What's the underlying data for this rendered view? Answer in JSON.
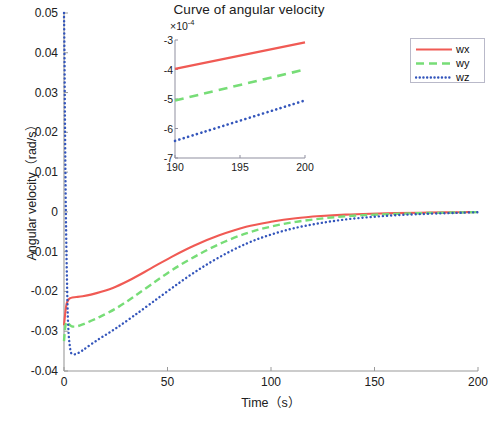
{
  "chart_data": {
    "type": "line",
    "title": "Curve of angular velocity",
    "xlabel": "Time（s）",
    "ylabel": "Angular velocity（rad/s）",
    "xlim": [
      0,
      200
    ],
    "ylim": [
      -0.04,
      0.05
    ],
    "xticks": [
      0,
      50,
      100,
      150,
      200
    ],
    "xtick_labels": [
      "0",
      "50",
      "100",
      "150",
      "200"
    ],
    "yticks": [
      0.05,
      0.04,
      0.03,
      0.02,
      0.01,
      0,
      -0.01,
      -0.02,
      -0.03,
      -0.04
    ],
    "ytick_labels": [
      "0.05",
      "0.04",
      "0.03",
      "0.02",
      "0.01",
      "0",
      "-0.01",
      "-0.02",
      "-0.03",
      "-0.04"
    ],
    "grid": false,
    "legend_position": "top-right",
    "series": [
      {
        "name": "wx",
        "color": "#f05a54",
        "style": "solid",
        "x": [
          0,
          0.6,
          1.2,
          2,
          3,
          4,
          6,
          9,
          13,
          18,
          25,
          33,
          42,
          52,
          63,
          75,
          88,
          100,
          112,
          124,
          136,
          148,
          160,
          172,
          184,
          192,
          200
        ],
        "y": [
          -0.0285,
          -0.0255,
          -0.0232,
          -0.0222,
          -0.0217,
          -0.0215,
          -0.0214,
          -0.0212,
          -0.0208,
          -0.0201,
          -0.0188,
          -0.0168,
          -0.0142,
          -0.0113,
          -0.00845,
          -0.0059,
          -0.00375,
          -0.0025,
          -0.0016,
          -0.00105,
          -0.00068,
          -0.00045,
          -0.0003,
          -0.0002,
          -0.00012,
          -8e-05,
          -3e-05
        ]
      },
      {
        "name": "wy",
        "color": "#77dd77",
        "style": "dashed",
        "x": [
          0,
          0.6,
          1.2,
          2,
          3,
          4,
          6,
          9,
          13,
          18,
          25,
          33,
          42,
          52,
          63,
          75,
          88,
          100,
          112,
          124,
          136,
          148,
          160,
          172,
          184,
          192,
          200
        ],
        "y": [
          -0.0325,
          -0.029,
          -0.0277,
          -0.028,
          -0.0285,
          -0.0288,
          -0.0288,
          -0.0283,
          -0.0274,
          -0.0262,
          -0.0243,
          -0.0216,
          -0.0183,
          -0.0147,
          -0.0113,
          -0.0081,
          -0.0054,
          -0.0037,
          -0.0025,
          -0.0017,
          -0.0011,
          -0.00075,
          -0.0005,
          -0.00033,
          -0.0002,
          -0.00014,
          -5e-05
        ]
      },
      {
        "name": "wz",
        "color": "#3355bb",
        "style": "dotted",
        "x": [
          0,
          0.25,
          0.5,
          0.9,
          1.4,
          2,
          3,
          4,
          6,
          9,
          13,
          18,
          25,
          33,
          42,
          52,
          63,
          75,
          88,
          100,
          112,
          124,
          136,
          148,
          160,
          172,
          184,
          192,
          200
        ],
        "y": [
          0.05,
          0.0385,
          0.021,
          0.0,
          -0.016,
          -0.0285,
          -0.0345,
          -0.0357,
          -0.0357,
          -0.0348,
          -0.0333,
          -0.0316,
          -0.0293,
          -0.0264,
          -0.023,
          -0.0192,
          -0.0152,
          -0.0114,
          -0.008,
          -0.0057,
          -0.004,
          -0.0028,
          -0.0019,
          -0.0013,
          -0.00085,
          -0.00055,
          -0.00033,
          -0.00022,
          -8e-05
        ]
      }
    ]
  },
  "legend": {
    "entries": [
      {
        "label": "wx"
      },
      {
        "label": "wy"
      },
      {
        "label": "wz"
      }
    ]
  },
  "inset": {
    "exponent_prefix": "×10",
    "exponent_power": "-4",
    "xlim": [
      190,
      200
    ],
    "ylim": [
      -7,
      -3
    ],
    "xticks": [
      190,
      195,
      200
    ],
    "xtick_labels": [
      "190",
      "195",
      "200"
    ],
    "yticks": [
      -3,
      -4,
      -5,
      -6,
      -7
    ],
    "ytick_labels": [
      "-3",
      "-4",
      "-5",
      "-6",
      "-7"
    ],
    "series": [
      {
        "name": "wx",
        "color": "#f05a54",
        "style": "solid",
        "x": [
          190,
          200
        ],
        "y": [
          -3.98,
          -3.08
        ]
      },
      {
        "name": "wy",
        "color": "#77dd77",
        "style": "dashed",
        "x": [
          190,
          200
        ],
        "y": [
          -5.05,
          -4.0
        ]
      },
      {
        "name": "wz",
        "color": "#3355bb",
        "style": "dotted",
        "x": [
          190,
          200
        ],
        "y": [
          -6.42,
          -5.05
        ]
      }
    ]
  }
}
